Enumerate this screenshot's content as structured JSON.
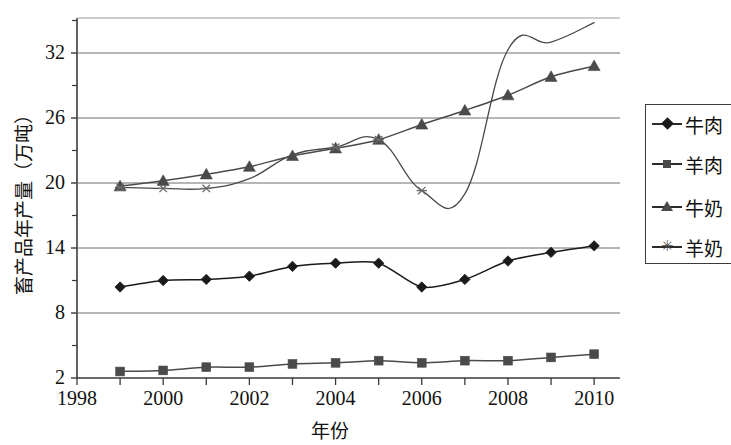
{
  "chart_data": {
    "type": "line",
    "title": "",
    "xlabel": "年份",
    "ylabel": "畜产品年产量（万吨）",
    "x": [
      1999,
      2000,
      2001,
      2002,
      2003,
      2004,
      2005,
      2006,
      2007,
      2008,
      2009,
      2010
    ],
    "xlim": [
      1998,
      2010.6
    ],
    "ylim": [
      2,
      36
    ],
    "xticks": [
      1998,
      1999,
      2000,
      2001,
      2002,
      2003,
      2004,
      2005,
      2006,
      2007,
      2008,
      2009,
      2010
    ],
    "xtick_labels": [
      "1998",
      "",
      "2000",
      "",
      "2002",
      "",
      "2004",
      "",
      "2006",
      "",
      "2008",
      "",
      "2010"
    ],
    "xtick_labels_shown": [
      "1998",
      "2000",
      "2002",
      "2004",
      "2006",
      "2008",
      "2010"
    ],
    "yticks": [
      2,
      8,
      14,
      20,
      26,
      32
    ],
    "ytick_labels": [
      "2",
      "8",
      "14",
      "20",
      "26",
      "32"
    ],
    "yminor_ticks": [
      5,
      11,
      17,
      23,
      29,
      35
    ],
    "grid": "horizontal",
    "legend_position": "right",
    "series": [
      {
        "name": "牛肉",
        "marker": "diamond",
        "color": "#1a1a1a",
        "values": [
          10.4,
          11.0,
          11.1,
          11.4,
          12.3,
          12.6,
          12.6,
          10.4,
          11.1,
          12.8,
          13.6,
          14.2
        ]
      },
      {
        "name": "羊肉",
        "marker": "square",
        "color": "#4a4a4a",
        "values": [
          2.6,
          2.7,
          3.0,
          3.0,
          3.3,
          3.4,
          3.6,
          3.4,
          3.6,
          3.6,
          3.9,
          4.2
        ]
      },
      {
        "name": "牛奶",
        "marker": "triangle",
        "color": "#4a4a4a",
        "values": [
          19.7,
          20.2,
          20.8,
          21.5,
          22.5,
          23.2,
          24.0,
          25.4,
          26.7,
          28.1,
          29.8,
          30.8
        ]
      },
      {
        "name": "羊奶",
        "marker": "star",
        "color": "#4a4a4a",
        "values": [
          19.6,
          19.5,
          19.5,
          20.4,
          22.6,
          23.3,
          24.0,
          19.3,
          19.0,
          32.3,
          33.0,
          34.8
        ]
      }
    ]
  },
  "legend": {
    "items": [
      {
        "label": "牛肉",
        "marker": "diamond"
      },
      {
        "label": "羊肉",
        "marker": "square"
      },
      {
        "label": "牛奶",
        "marker": "triangle"
      },
      {
        "label": "羊奶",
        "marker": "star"
      }
    ]
  },
  "axes": {
    "y_title": "畜产品年产量（万吨）",
    "x_title": "年份"
  }
}
